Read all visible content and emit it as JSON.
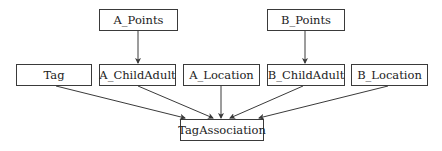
{
  "diagram": {
    "type": "entity-dependency",
    "nodes": [
      {
        "id": "a_points",
        "label": "A_Points",
        "x": 99,
        "y": 9,
        "w": 79,
        "h": 22
      },
      {
        "id": "b_points",
        "label": "B_Points",
        "x": 267,
        "y": 9,
        "w": 78,
        "h": 22
      },
      {
        "id": "tag",
        "label": "Tag",
        "x": 16,
        "y": 64,
        "w": 76,
        "h": 22
      },
      {
        "id": "a_childadult",
        "label": "A_ChildAdult",
        "x": 99,
        "y": 64,
        "w": 77,
        "h": 22
      },
      {
        "id": "a_location",
        "label": "A_Location",
        "x": 183,
        "y": 64,
        "w": 77,
        "h": 22
      },
      {
        "id": "b_childadult",
        "label": "B_ChildAdult",
        "x": 267,
        "y": 64,
        "w": 78,
        "h": 22
      },
      {
        "id": "b_location",
        "label": "B_Location",
        "x": 351,
        "y": 64,
        "w": 77,
        "h": 22
      },
      {
        "id": "tagassociation",
        "label": "TagAssociation",
        "x": 180,
        "y": 119,
        "w": 84,
        "h": 22
      }
    ],
    "edges": [
      {
        "from": "a_points",
        "to": "a_childadult",
        "x1": 138,
        "y1": 31,
        "x2": 138,
        "y2": 63
      },
      {
        "from": "b_points",
        "to": "b_childadult",
        "x1": 305,
        "y1": 31,
        "x2": 305,
        "y2": 63
      },
      {
        "from": "tag",
        "to": "tagassociation",
        "x1": 56,
        "y1": 86,
        "x2": 185,
        "y2": 118
      },
      {
        "from": "a_childadult",
        "to": "tagassociation",
        "x1": 138,
        "y1": 86,
        "x2": 213,
        "y2": 118
      },
      {
        "from": "a_location",
        "to": "tagassociation",
        "x1": 221,
        "y1": 86,
        "x2": 221,
        "y2": 118
      },
      {
        "from": "b_childadult",
        "to": "tagassociation",
        "x1": 303,
        "y1": 86,
        "x2": 230,
        "y2": 118
      },
      {
        "from": "b_location",
        "to": "tagassociation",
        "x1": 388,
        "y1": 86,
        "x2": 259,
        "y2": 118
      }
    ],
    "colors": {
      "stroke": "#3a3a3a",
      "text": "#222222",
      "background": "#ffffff"
    }
  }
}
